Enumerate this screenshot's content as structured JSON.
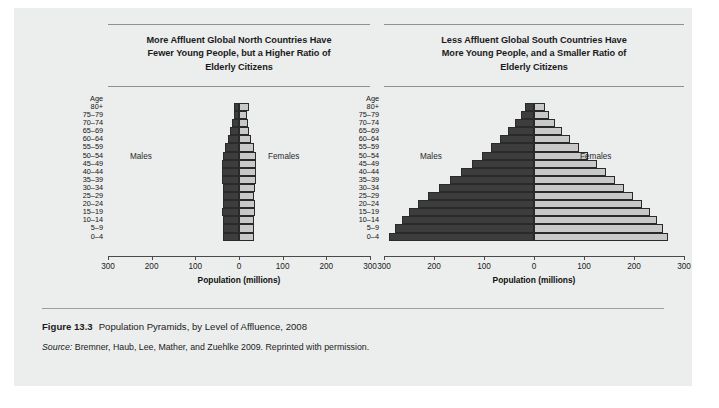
{
  "figure": {
    "number": "Figure 13.3",
    "title": "Population Pyramids, by Level of Affluence, 2008",
    "source_label": "Source:",
    "source_text": "Bremner, Haub, Lee, Mather, and Zuehlke 2009. Reprinted with permission."
  },
  "colors": {
    "card_background": "#eceded",
    "page_background": "#ffffff",
    "male_bar": "#3d3d3d",
    "female_bar": "#c9c9c9",
    "bar_outline": "#2a2a2a",
    "axis": "#4a4a4a",
    "rule": "#8d8f90",
    "text": "#1b1b1b"
  },
  "common": {
    "age_header": "Age",
    "males_label": "Males",
    "females_label": "Females",
    "axis_title": "Population (millions)",
    "tick_labels": [
      "300",
      "200",
      "100",
      "0",
      "100",
      "200",
      "300"
    ],
    "age_groups": [
      "80+",
      "75–79",
      "70–74",
      "65–69",
      "60–64",
      "55–59",
      "50–54",
      "45–49",
      "40–44",
      "35–39",
      "30–34",
      "25–29",
      "20–24",
      "15–19",
      "10–14",
      "5–9",
      "0–4"
    ]
  },
  "chart_data": [
    {
      "type": "bar",
      "subtype": "population-pyramid",
      "panel": "left",
      "title": "More Affluent Global North Countries Have Fewer Young People, but a Higher Ratio of Elderly Citizens",
      "title_lines": [
        "More Affluent Global North Countries Have",
        "Fewer Young People, but a Higher Ratio of",
        "Elderly Citizens"
      ],
      "xlabel": "Population (millions)",
      "ylabel": "Age",
      "xlim": [
        -300,
        300
      ],
      "xticks": [
        -300,
        -200,
        -100,
        0,
        100,
        200,
        300
      ],
      "xtick_labels": [
        "300",
        "200",
        "100",
        "0",
        "100",
        "200",
        "300"
      ],
      "grid": false,
      "legend": [
        "Males",
        "Females"
      ],
      "legend_position": "inline-left-right",
      "categories": [
        "80+",
        "75–79",
        "70–74",
        "65–69",
        "60–64",
        "55–59",
        "50–54",
        "45–49",
        "40–44",
        "35–39",
        "30–34",
        "25–29",
        "20–24",
        "15–19",
        "10–14",
        "5–9",
        "0–4"
      ],
      "series": [
        {
          "name": "Males",
          "side": "left",
          "values": [
            12,
            12,
            16,
            20,
            25,
            32,
            37,
            39,
            39,
            38,
            37,
            36,
            37,
            38,
            37,
            36,
            37
          ]
        },
        {
          "name": "Females",
          "side": "right",
          "values": [
            24,
            18,
            21,
            23,
            28,
            34,
            38,
            40,
            39,
            38,
            37,
            35,
            36,
            36,
            35,
            34,
            35
          ]
        }
      ]
    },
    {
      "type": "bar",
      "subtype": "population-pyramid",
      "panel": "right",
      "title": "Less Affluent Global South Countries Have More Young People, and a Smaller Ratio of Elderly Citizens",
      "title_lines": [
        "Less Affluent Global South Countries Have",
        "More Young People, and a Smaller Ratio of",
        "Elderly Citizens"
      ],
      "xlabel": "Population (millions)",
      "ylabel": "Age",
      "xlim": [
        -300,
        300
      ],
      "xticks": [
        -300,
        -200,
        -100,
        0,
        100,
        200,
        300
      ],
      "xtick_labels": [
        "300",
        "200",
        "100",
        "0",
        "100",
        "200",
        "300"
      ],
      "grid": false,
      "legend": [
        "Males",
        "Females"
      ],
      "legend_position": "inline-left-right",
      "categories": [
        "80+",
        "75–79",
        "70–74",
        "65–69",
        "60–64",
        "55–59",
        "50–54",
        "45–49",
        "40–44",
        "35–39",
        "30–34",
        "25–29",
        "20–24",
        "15–19",
        "10–14",
        "5–9",
        "0–4"
      ],
      "series": [
        {
          "name": "Males",
          "side": "left",
          "values": [
            18,
            26,
            38,
            52,
            68,
            86,
            105,
            125,
            146,
            168,
            190,
            212,
            232,
            250,
            265,
            278,
            290
          ]
        },
        {
          "name": "Females",
          "side": "right",
          "values": [
            22,
            30,
            42,
            56,
            72,
            90,
            108,
            126,
            144,
            162,
            180,
            198,
            215,
            232,
            246,
            258,
            268
          ]
        }
      ]
    }
  ]
}
